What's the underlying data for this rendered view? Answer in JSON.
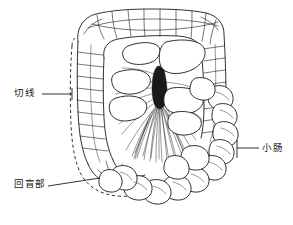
{
  "figure": {
    "background_color": "#ffffff",
    "ink_color": "#1a1a1a",
    "width": 293,
    "height": 225
  },
  "labels": [
    {
      "id": "cut-line",
      "text": "切线",
      "leader": {
        "x1": 42,
        "y1": 94,
        "x2": 72,
        "y2": 94,
        "tick": true
      }
    },
    {
      "id": "ileocecal",
      "text": "回盲部",
      "leader": {
        "x1": 48,
        "y1": 186,
        "x2": 100,
        "y2": 178,
        "tick": false
      }
    },
    {
      "id": "small-intestine",
      "text": "小肠",
      "leader": {
        "x1": 237,
        "y1": 148,
        "x2": 259,
        "y2": 148,
        "tick": true
      }
    }
  ],
  "structures": {
    "colon_frame": "结肠框",
    "transverse_colon": "横结肠",
    "ascending_colon": "升结肠",
    "descending_colon": "降结肠",
    "cecum": "盲肠",
    "mesentery_fan": "肠系扇",
    "small_bowel_loops": "小肠袢",
    "dashed_cut_line": "虚线切线"
  }
}
